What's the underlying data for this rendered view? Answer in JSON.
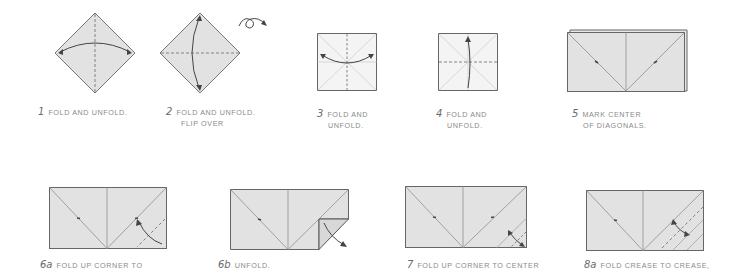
{
  "colors": {
    "paper_fill": "#e2e2e2",
    "paper_edge": "#666666",
    "crease": "#a8a8a8",
    "valley_fold": "#777777",
    "arrow": "#444444",
    "caption_text": "#8a8a8a",
    "step_number": "#6a6a6a",
    "background": "#ffffff"
  },
  "steps": [
    {
      "number": "1",
      "text": "FOLD AND UNFOLD.",
      "line2": ""
    },
    {
      "number": "2",
      "text": "FOLD AND UNFOLD.",
      "line2": "FLIP OVER"
    },
    {
      "number": "3",
      "text": "FOLD AND",
      "line2": "UNFOLD."
    },
    {
      "number": "4",
      "text": "FOLD AND",
      "line2": "UNFOLD."
    },
    {
      "number": "5",
      "text": "MARK CENTER",
      "line2": "OF DIAGONALS."
    },
    {
      "number": "6a",
      "text": "FOLD UP CORNER TO",
      "line2": ""
    },
    {
      "number": "6b",
      "text": "UNFOLD.",
      "line2": ""
    },
    {
      "number": "7",
      "text": "FOLD UP CORNER TO CENTER",
      "line2": ""
    },
    {
      "number": "8a",
      "text": "FOLD CREASE TO CREASE,",
      "line2": ""
    }
  ],
  "icons": {
    "flip_over": "flip-over-arrow-icon"
  }
}
